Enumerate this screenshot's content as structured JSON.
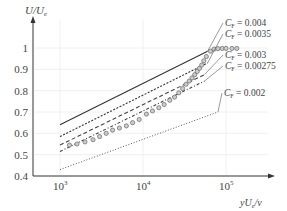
{
  "chart_data": {
    "type": "line",
    "title": "",
    "xlabel": "yUₑ/ν",
    "ylabel": "U/Uₑ",
    "xscale": "log",
    "xlim": [
      700,
      250000
    ],
    "ylim": [
      0.4,
      1.05
    ],
    "x_ticks": [
      {
        "value": 1000,
        "label": "10³"
      },
      {
        "value": 10000,
        "label": "10⁴"
      },
      {
        "value": 100000,
        "label": "10⁵"
      }
    ],
    "y_ticks": [
      {
        "value": 0.4,
        "label": "0.4"
      },
      {
        "value": 0.5,
        "label": "0.5"
      },
      {
        "value": 0.6,
        "label": "0.6"
      },
      {
        "value": 0.7,
        "label": "0.7"
      },
      {
        "value": 0.8,
        "label": "0.8"
      },
      {
        "value": 0.9,
        "label": "0.9"
      },
      {
        "value": 1.0,
        "label": "1"
      }
    ],
    "grid": true,
    "series": [
      {
        "name": "C_F = 0.004",
        "style": "solid",
        "x": [
          1000,
          60000
        ],
        "y": [
          0.64,
          0.985
        ],
        "label": "C_F = 0.004"
      },
      {
        "name": "C_F = 0.0035",
        "style": "dotted-dense",
        "x": [
          1000,
          60000
        ],
        "y": [
          0.585,
          0.93
        ],
        "label": "C_F = 0.0035"
      },
      {
        "name": "C_F = 0.003",
        "style": "dashed",
        "x": [
          1000,
          55000
        ],
        "y": [
          0.545,
          0.875
        ],
        "label": "C_F = 0.003"
      },
      {
        "name": "C_F = 0.00275",
        "style": "dash-dot",
        "x": [
          1000,
          55000
        ],
        "y": [
          0.515,
          0.845
        ],
        "label": "C_F = 0.00275"
      },
      {
        "name": "C_F = 0.002",
        "style": "dotted",
        "x": [
          1000,
          80000
        ],
        "y": [
          0.43,
          0.7
        ],
        "label": "C_F = 0.002"
      },
      {
        "name": "measured",
        "style": "markers",
        "x": [
          1300,
          1600,
          2000,
          2500,
          3000,
          3600,
          4300,
          5200,
          6300,
          7500,
          9000,
          11000,
          13000,
          15500,
          18000,
          21000,
          24000,
          27000,
          30000,
          33000,
          36000,
          39000,
          42000,
          45000,
          48000,
          51000,
          54000,
          58000,
          65000,
          72000,
          80000,
          90000,
          100000,
          118000,
          135000
        ],
        "y": [
          0.545,
          0.55,
          0.56,
          0.57,
          0.585,
          0.6,
          0.615,
          0.625,
          0.635,
          0.65,
          0.665,
          0.69,
          0.705,
          0.72,
          0.735,
          0.755,
          0.77,
          0.79,
          0.81,
          0.83,
          0.845,
          0.86,
          0.875,
          0.89,
          0.905,
          0.92,
          0.94,
          0.96,
          0.985,
          0.995,
          0.997,
          0.998,
          0.998,
          0.998,
          0.998
        ]
      }
    ],
    "annotations": [
      {
        "text": "C_F = 0.004"
      },
      {
        "text": "C_F = 0.0035"
      },
      {
        "text": "C_F = 0.003"
      },
      {
        "text": "C_F = 0.00275"
      },
      {
        "text": "C_F = 0.002"
      }
    ]
  },
  "axes": {
    "y_label": "U/U",
    "y_label_sub": "e",
    "x_label": "yU",
    "x_label_sub": "e",
    "x_label_tail": "/ν",
    "y_ticks": [
      "0.4",
      "0.5",
      "0.6",
      "0.7",
      "0.8",
      "0.9",
      "1"
    ],
    "x_ticks": [
      {
        "base": "10",
        "exp": "3"
      },
      {
        "base": "10",
        "exp": "4"
      },
      {
        "base": "10",
        "exp": "5"
      }
    ]
  },
  "legend": [
    {
      "prefix": "C",
      "sub": "F",
      "value": " = 0.004"
    },
    {
      "prefix": "C",
      "sub": "F",
      "value": " = 0.0035"
    },
    {
      "prefix": "C",
      "sub": "F",
      "value": " = 0.003"
    },
    {
      "prefix": "C",
      "sub": "F",
      "value": " = 0.00275"
    },
    {
      "prefix": "C",
      "sub": "F",
      "value": " = 0.002"
    }
  ]
}
